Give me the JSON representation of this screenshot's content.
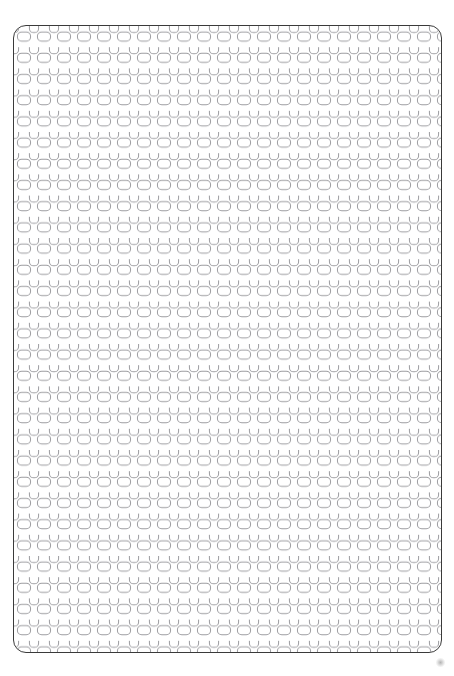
{
  "document": {
    "title": "Perforated Panel Pattern",
    "description": "A white rounded-rectangle panel filled with a dense repeating grid of rounded-rectangle (pill) outlines in alternating vertical and horizontal orientations.",
    "background_color": "#ffffff"
  },
  "panel": {
    "name": "perforated-panel",
    "x": 13,
    "y": 25,
    "width": 429,
    "height": 628,
    "corner_radius": 13,
    "fill_color": "#ffffff",
    "border_color": "#3a3a3a",
    "border_width": 1.4
  },
  "pattern": {
    "type": "alternating-pill-grid",
    "stroke_color": "#9a9a9e",
    "stroke_width": 1.0,
    "fill_color": "none",
    "tile_width": 20,
    "tile_height": 21.2,
    "vertical_pill": {
      "name": "vertical-pill",
      "orientation": "vertical",
      "width": 9.2,
      "height": 13.2,
      "corner_radius": 4.3,
      "offset_x": 0,
      "offset_y": 0
    },
    "horizontal_pill": {
      "name": "horizontal-pill",
      "orientation": "horizontal",
      "width": 13.2,
      "height": 9.2,
      "corner_radius": 4.3,
      "offset_x": 10,
      "offset_y": 10.6
    },
    "columns_across": 21,
    "rows_down": 30
  },
  "artifact": {
    "name": "corner-smudge",
    "x": 436,
    "y": 658,
    "size": 9,
    "color": "#787878",
    "opacity": 0.55
  }
}
